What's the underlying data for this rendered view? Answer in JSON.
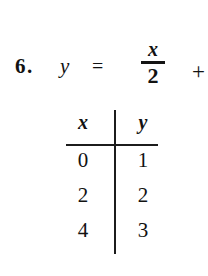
{
  "problem": {
    "number_label": "6.",
    "equation": {
      "left_side": "y",
      "equals": "=",
      "fraction_numerator": "x",
      "fraction_denominator": "2",
      "operator": "+"
    },
    "table": {
      "headers": [
        "x",
        "y"
      ],
      "rows": [
        [
          "0",
          "1"
        ],
        [
          "2",
          "2"
        ],
        [
          "4",
          "3"
        ]
      ]
    }
  },
  "colors": {
    "ink": "#121212",
    "rule": "#1c1c1c",
    "page": "#ffffff"
  }
}
